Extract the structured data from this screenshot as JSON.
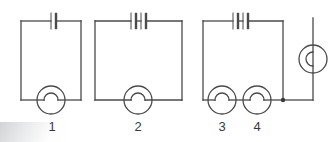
{
  "figure": {
    "type": "circuit-diagram",
    "background_color": "#ffffff",
    "line_color": "#4a4a4a",
    "label_color": "#3a3a3a",
    "width": 329,
    "height": 142
  },
  "labels": [
    {
      "text": "1",
      "x": 42,
      "y": 120
    },
    {
      "text": "2",
      "x": 138,
      "y": 120
    },
    {
      "text": "3",
      "x": 222,
      "y": 120
    },
    {
      "text": "4",
      "x": 257,
      "y": 120
    }
  ],
  "circuits": [
    {
      "name": "circuit-one",
      "cells": 1,
      "lamps": [
        "1"
      ],
      "lamp_arrangement": "single"
    },
    {
      "name": "circuit-two",
      "cells": 2,
      "lamps": [
        "2"
      ],
      "lamp_arrangement": "single"
    },
    {
      "name": "circuit-three",
      "cells": 2,
      "lamps": [
        "3",
        "4"
      ],
      "lamp_arrangement": "series"
    },
    {
      "name": "circuit-four-partial",
      "cells": 0,
      "lamps": [],
      "lamp_arrangement": "cut-off-at-edge"
    }
  ],
  "symbols": {
    "battery_cell": "battery-cell-symbol",
    "lamp": "lamp-symbol",
    "junction": "junction-dot",
    "wire": "wire-segment"
  }
}
